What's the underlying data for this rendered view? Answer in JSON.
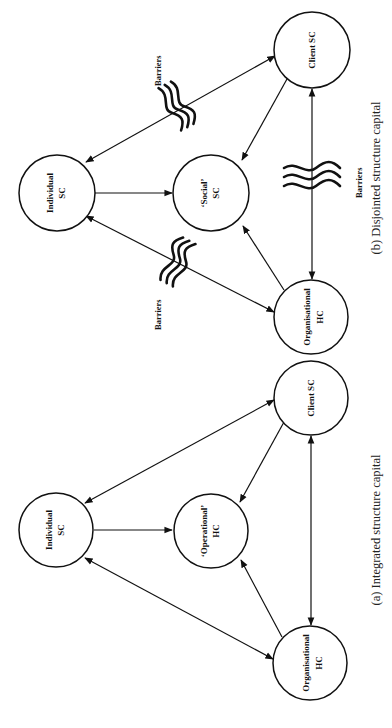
{
  "panels": [
    {
      "id": "b",
      "caption": "(b) Disjointed structure capital",
      "nodes": {
        "individual": [
          "Individual",
          "SC"
        ],
        "center": [
          "‘Social’",
          "SC"
        ],
        "client": [
          "Client SC"
        ],
        "organisational": [
          "Organisational",
          "HC"
        ]
      },
      "barriers": {
        "label": "Barriers",
        "count": 3
      }
    },
    {
      "id": "a",
      "caption": "(a) Integrated structure capital",
      "nodes": {
        "individual": [
          "Individual",
          "SC"
        ],
        "center": [
          "‘Operational’",
          "HC"
        ],
        "client": [
          "Client SC"
        ],
        "organisational": [
          "Organisational",
          "HC"
        ]
      }
    }
  ],
  "p_b_ind_1": "Individual",
  "p_b_ind_2": "SC",
  "p_b_cen_1": "‘Social’",
  "p_b_cen_2": "SC",
  "p_b_cli": "Client SC",
  "p_b_org_1": "Organisational",
  "p_b_org_2": "HC",
  "p_b_barrier_1": "Barriers",
  "p_b_barrier_2": "Barriers",
  "p_b_barrier_3": "Barriers",
  "p_b_caption": "(b) Disjointed structure capital",
  "p_a_ind_1": "Individual",
  "p_a_ind_2": "SC",
  "p_a_cen_1": "‘Operational’",
  "p_a_cen_2": "HC",
  "p_a_cli": "Client SC",
  "p_a_org_1": "Organisational",
  "p_a_org_2": "HC",
  "p_a_caption": "(a) Integrated structure capital",
  "colors": {
    "ink": "#111111",
    "background": "#ffffff"
  }
}
